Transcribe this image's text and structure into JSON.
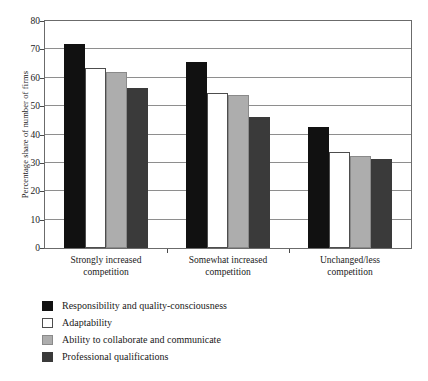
{
  "chart_data": {
    "type": "bar",
    "title": "",
    "xlabel": "",
    "ylabel": "Percentage share of number of firms",
    "ylim": [
      0,
      80
    ],
    "yticks": [
      0,
      10,
      20,
      30,
      40,
      50,
      60,
      70,
      80
    ],
    "grid": true,
    "legend_position": "below-left",
    "categories": [
      "Strongly increased competition",
      "Somewhat increased competition",
      "Unchanged/less competition"
    ],
    "category_lines": [
      [
        "Strongly increased",
        "competition"
      ],
      [
        "Somewhat increased",
        "competition"
      ],
      [
        "Unchanged/less",
        "competition"
      ]
    ],
    "series": [
      {
        "name": "Responsibility and quality-consciousness",
        "color": "#111111",
        "values": [
          72.0,
          65.5,
          42.5
        ]
      },
      {
        "name": "Adaptability",
        "color": "#ffffff",
        "values": [
          63.5,
          54.5,
          34.0
        ]
      },
      {
        "name": "Ability to collaborate and communicate",
        "color": "#adadad",
        "values": [
          62.0,
          54.0,
          32.5
        ]
      },
      {
        "name": "Professional qualifications",
        "color": "#3a3a3a",
        "values": [
          56.5,
          46.0,
          31.5
        ]
      }
    ]
  },
  "legend": {
    "items": [
      "Responsibility and quality-consciousness",
      "Adaptability",
      "Ability to collaborate and communicate",
      "Professional qualifications"
    ]
  }
}
